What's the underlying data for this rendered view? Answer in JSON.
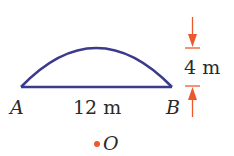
{
  "diagram": {
    "points": {
      "A": {
        "label": "A"
      },
      "B": {
        "label": "B"
      },
      "O": {
        "label": "O"
      }
    },
    "chord_length_label": "12 m",
    "arc_height_label": "4 m",
    "colors": {
      "arc": "#3b3a8c",
      "dimension": "#ec5a2c",
      "text": "#2a2a2a",
      "center_dot": "#ec5a2c"
    }
  }
}
